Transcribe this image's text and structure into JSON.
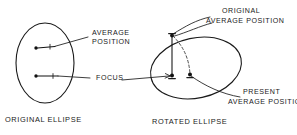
{
  "figure": {
    "type": "technical-line-diagram",
    "background_color": "#ffffff",
    "ink_color": "#1a1a1a"
  },
  "left_panel": {
    "caption": "ORIGINAL ELLIPSE",
    "shape_name": "original-ellipse",
    "labels": {
      "average_position_line1": "AVERAGE",
      "average_position_line2": "POSITION",
      "focus": "FOCUS"
    },
    "markers": [
      {
        "name": "average-position-marker",
        "role": "average position dot with short bar"
      },
      {
        "name": "focus-marker",
        "role": "focus dot with short bar"
      }
    ]
  },
  "right_panel": {
    "caption": "ROTATED ELLIPSE",
    "shape_name": "rotated-ellipse",
    "labels": {
      "original_average_position_line1": "ORIGINAL",
      "original_average_position_line2": "AVERAGE POSITION",
      "present_average_position_line1": "PRESENT",
      "present_average_position_line2": "AVERAGE POSITION"
    },
    "markers": [
      {
        "name": "original-average-position-marker",
        "role": "top dot on ellipse rim"
      },
      {
        "name": "focus-marker",
        "role": "left interior focus dot"
      },
      {
        "name": "present-average-position-marker",
        "role": "right interior dot"
      }
    ],
    "rotation_arc": {
      "name": "rotation-arc",
      "style": "dashed",
      "role": "arc from original average position to present average position"
    }
  }
}
